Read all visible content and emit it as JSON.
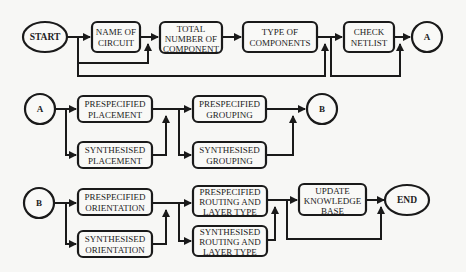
{
  "diagram": {
    "row1": {
      "start": "START",
      "name_of_circuit": [
        "NAME OF",
        "CIRCUIT"
      ],
      "total_number": [
        "TOTAL",
        "NUMBER OF",
        "COMPONENT"
      ],
      "type_of_components": [
        "TYPE OF",
        "COMPONENTS"
      ],
      "check_netlist": [
        "CHECK",
        "NETLIST"
      ],
      "connector_out": "A"
    },
    "row2": {
      "connector_in": "A",
      "prespecified_placement": [
        "PRESPECIFIED",
        "PLACEMENT"
      ],
      "synthesised_placement": [
        "SYNTHESISED",
        "PLACEMENT"
      ],
      "prespecified_grouping": [
        "PRESPECIFIED",
        "GROUPING"
      ],
      "synthesised_grouping": [
        "SYNTHESISED",
        "GROUPING"
      ],
      "connector_out": "B"
    },
    "row3": {
      "connector_in": "B",
      "prespecified_orientation": [
        "PRESPECIFIED",
        "ORIENTATION"
      ],
      "synthesised_orientation": [
        "SYNTHESISED",
        "ORIENTATION"
      ],
      "prespecified_routing": [
        "PRESPECIFIED",
        "ROUTING AND",
        "LAYER TYPE"
      ],
      "synthesised_routing": [
        "SYNTHESISED",
        "ROUTING AND",
        "LAYER TYPE"
      ],
      "update_knowledge_base": [
        "UPDATE",
        "KNOWLEDGE",
        "BASE"
      ],
      "end": "END"
    }
  },
  "colors": {
    "stroke": "#1a1a1a",
    "background": "#f7f7f5",
    "box_fill": "#f9f9f7"
  }
}
